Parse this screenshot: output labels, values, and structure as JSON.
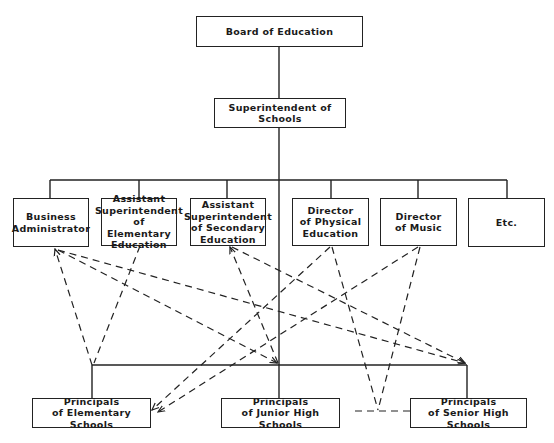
{
  "diagram": {
    "type": "organizational-chart",
    "nodes": {
      "board": {
        "lines": [
          "Board of Education"
        ]
      },
      "superintendent": {
        "lines": [
          "Superintendent of Schools"
        ]
      },
      "business": {
        "lines": [
          "Business",
          "Administrator"
        ]
      },
      "asst_elem": {
        "lines": [
          "Assistant",
          "Superintendent",
          "of Elementary",
          "Education"
        ]
      },
      "asst_sec": {
        "lines": [
          "Assistant",
          "Superintendent",
          "of Secondary",
          "Education"
        ]
      },
      "dir_pe": {
        "lines": [
          "Director",
          "of Physical",
          "Education"
        ]
      },
      "dir_music": {
        "lines": [
          "Director",
          "of Music"
        ]
      },
      "etc": {
        "lines": [
          "Etc."
        ]
      },
      "prin_elem": {
        "lines": [
          "Principals",
          "of Elementary Schools"
        ]
      },
      "prin_junior": {
        "lines": [
          "Principals",
          "of Junior High Schools"
        ]
      },
      "prin_senior": {
        "lines": [
          "Principals",
          "of Senior High Schools"
        ]
      }
    },
    "line_color": "#222222",
    "solid_edges": [
      [
        "board",
        "superintendent"
      ],
      [
        "superintendent",
        "business"
      ],
      [
        "superintendent",
        "asst_elem"
      ],
      [
        "superintendent",
        "asst_sec"
      ],
      [
        "superintendent",
        "dir_pe"
      ],
      [
        "superintendent",
        "dir_music"
      ],
      [
        "superintendent",
        "etc"
      ],
      [
        "superintendent",
        "prin_elem"
      ],
      [
        "superintendent",
        "prin_junior"
      ],
      [
        "superintendent",
        "prin_senior"
      ]
    ],
    "dashed_edges": [
      [
        "business",
        "prin_elem"
      ],
      [
        "business",
        "prin_junior"
      ],
      [
        "business",
        "prin_senior"
      ],
      [
        "asst_elem",
        "prin_elem"
      ],
      [
        "asst_sec",
        "prin_junior"
      ],
      [
        "asst_sec",
        "prin_senior"
      ],
      [
        "dir_pe",
        "prin_elem"
      ],
      [
        "dir_pe",
        "prin_junior"
      ],
      [
        "dir_pe",
        "prin_senior"
      ],
      [
        "dir_music",
        "prin_elem"
      ],
      [
        "dir_music",
        "prin_junior"
      ],
      [
        "dir_music",
        "prin_senior"
      ],
      [
        "prin_junior",
        "prin_senior"
      ]
    ]
  }
}
